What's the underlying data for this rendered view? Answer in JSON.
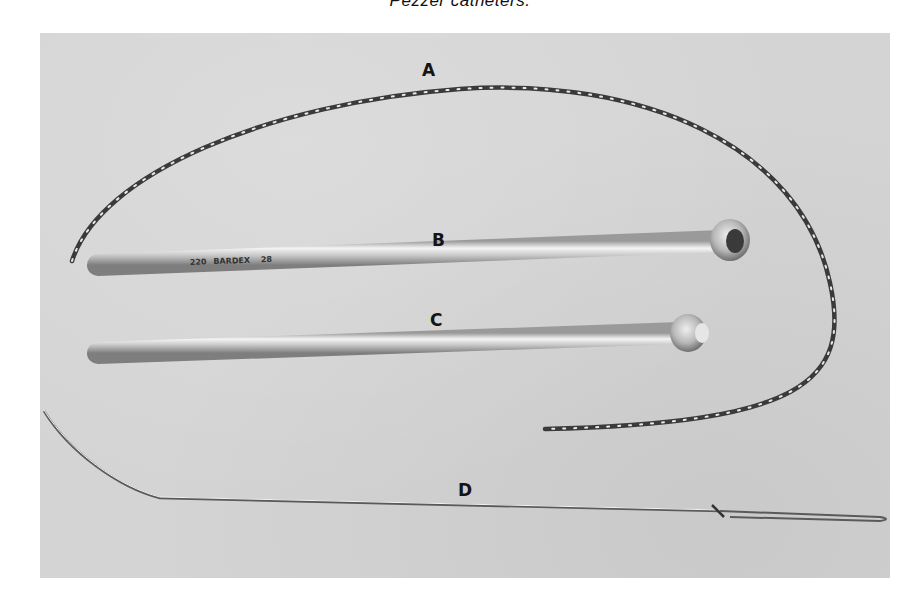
{
  "caption": "Pezzer catheters.",
  "figure": {
    "labels": [
      {
        "id": "A",
        "text": "A"
      },
      {
        "id": "B",
        "text": "B"
      },
      {
        "id": "C",
        "text": "C"
      },
      {
        "id": "D",
        "text": "D"
      }
    ],
    "catheter_b_print": "BARDEX",
    "catheter_b_print_prefix": "220",
    "catheter_b_print_size": "28"
  }
}
